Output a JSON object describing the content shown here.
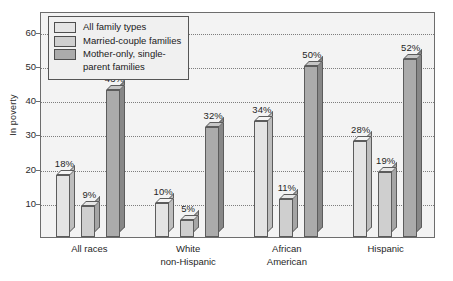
{
  "chart_data": {
    "type": "bar",
    "title": "",
    "subtitle": "",
    "xlabel": "",
    "ylabel": "In poverty",
    "ylim": [
      0,
      66
    ],
    "yticks": [
      10,
      20,
      30,
      40,
      50,
      60
    ],
    "ytick_labels": [
      "10",
      "20",
      "30",
      "40",
      "50",
      "60"
    ],
    "grid": true,
    "grid_style": "dotted-horizontal",
    "legend_position": "top-left",
    "value_label_suffix": "%",
    "categories": [
      "All races",
      "White\nnon-Hispanic",
      "African\nAmerican",
      "Hispanic"
    ],
    "series": [
      {
        "name": "All family types",
        "color": "#e4e4e4",
        "values": [
          18,
          10,
          34,
          28
        ],
        "labels": [
          "18%",
          "10%",
          "34%",
          "28%"
        ]
      },
      {
        "name": "Married-couple families",
        "color": "#cfcfcf",
        "values": [
          9,
          5,
          11,
          19
        ],
        "labels": [
          "9%",
          "5%",
          "11%",
          "19%"
        ]
      },
      {
        "name": "Mother-only, single-\nparent families",
        "color": "#ababab",
        "values": [
          43,
          32,
          50,
          52
        ],
        "labels": [
          "43%",
          "32%",
          "50%",
          "52%"
        ]
      }
    ]
  },
  "legend": {
    "items": [
      {
        "label": "All family types"
      },
      {
        "label": "Married-couple families"
      },
      {
        "label": "Mother-only, single-\nparent families"
      }
    ]
  },
  "colors": {
    "plot_background": "#f3f3f3",
    "frame": "#6d6d6d",
    "gridline": "#7d7d7d",
    "bar_outline": "#5c5c5c",
    "text": "#1f1f1f"
  }
}
